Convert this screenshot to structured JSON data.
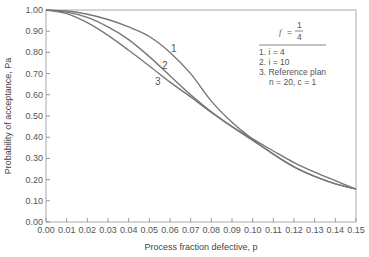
{
  "chart_data": {
    "type": "line",
    "title": "",
    "xlabel": "Process fraction defective, p",
    "ylabel": "Probability of acceptance, Pa",
    "xlim": [
      0.0,
      0.15
    ],
    "ylim": [
      0.0,
      1.0
    ],
    "x_ticks": [
      "0.00",
      "0.01",
      "0.02",
      "0.03",
      "0.04",
      "0.05",
      "0.06",
      "0.07",
      "0.08",
      "0.09",
      "0.10",
      "0.11",
      "0.12",
      "0.13",
      "0.14",
      "0.15"
    ],
    "y_ticks": [
      "0.00",
      "0.10",
      "0.20",
      "0.30",
      "0.40",
      "0.50",
      "0.60",
      "0.70",
      "0.80",
      "0.90",
      "1.00"
    ],
    "grid": false,
    "legend_position": "upper right",
    "legend": {
      "header": "f = 1/4",
      "entries": [
        "1. i = 4",
        "2. i = 10",
        "3. Reference plan",
        "n = 20, c = 1"
      ]
    },
    "x": [
      0.0,
      0.01,
      0.02,
      0.03,
      0.04,
      0.05,
      0.06,
      0.07,
      0.08,
      0.09,
      0.1,
      0.11,
      0.12,
      0.13,
      0.14,
      0.15
    ],
    "series": [
      {
        "name": "1",
        "values": [
          1.0,
          0.995,
          0.98,
          0.955,
          0.92,
          0.875,
          0.8,
          0.7,
          0.57,
          0.47,
          0.39,
          0.32,
          0.26,
          0.215,
          0.18,
          0.155
        ]
      },
      {
        "name": "2",
        "values": [
          1.0,
          0.99,
          0.965,
          0.92,
          0.86,
          0.78,
          0.69,
          0.6,
          0.52,
          0.45,
          0.385,
          0.32,
          0.26,
          0.215,
          0.18,
          0.155
        ]
      },
      {
        "name": "3",
        "values": [
          1.0,
          0.983,
          0.94,
          0.88,
          0.81,
          0.736,
          0.66,
          0.59,
          0.517,
          0.45,
          0.392,
          0.335,
          0.28,
          0.235,
          0.195,
          0.155
        ]
      }
    ],
    "annotations": [
      "1",
      "2",
      "3"
    ]
  }
}
